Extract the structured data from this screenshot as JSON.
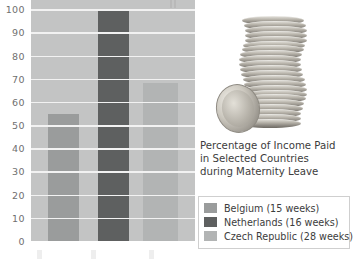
{
  "caption": {
    "line1": "Percentage of Income Paid",
    "line2": "in Selected Countries",
    "line3": "during Maternity Leave"
  },
  "legend": {
    "items": [
      {
        "label": "Belgium (15 weeks)",
        "color": "#9a9c9c"
      },
      {
        "label": "Netherlands (16 weeks)",
        "color": "#5e6060"
      },
      {
        "label": "Czech Republic (28 weeks)",
        "color": "#b2b4b4"
      }
    ]
  },
  "image": {
    "alt": "stack-of-coins"
  },
  "chart_data": {
    "type": "bar",
    "title": "Percentage of Income Paid in Selected Countries during Maternity Leave",
    "categories": [
      "Belgium (15 weeks)",
      "Netherlands (16 weeks)",
      "Czech Republic (28 weeks)"
    ],
    "values": [
      55,
      100,
      68
    ],
    "colors": [
      "#9a9c9c",
      "#5e6060",
      "#b2b4b4"
    ],
    "xlabel": "",
    "ylabel": "",
    "ylim": [
      0,
      100
    ],
    "yticks": [
      0,
      10,
      20,
      30,
      40,
      50,
      60,
      70,
      80,
      90,
      100
    ],
    "ytick_labels": [
      "0",
      "10",
      "20",
      "30",
      "40",
      "50",
      "60",
      "70",
      "80",
      "90",
      "100"
    ],
    "grid": "horizontal",
    "plot_background": "#c3c4c4",
    "gridline_color": "#f2f2f2",
    "legend_position": "right"
  }
}
